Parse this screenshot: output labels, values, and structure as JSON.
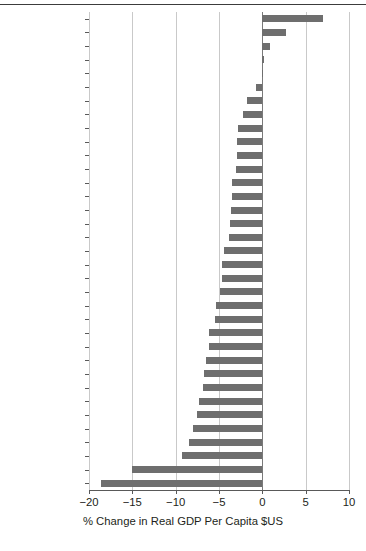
{
  "chart_data": {
    "type": "bar",
    "orientation": "horizontal",
    "title": "",
    "subtitle": "",
    "xlabel": "% Change in Real GDP Per Capita $US",
    "ylabel": "",
    "xlim": [
      -20,
      10
    ],
    "ylim": null,
    "xticks": [
      -20,
      -15,
      -10,
      -5,
      0,
      5,
      10
    ],
    "xticklabels": [
      "−20",
      "−15",
      "−10",
      "−5",
      "0",
      "5",
      "10"
    ],
    "grid": "vertical",
    "legend": "none",
    "bar_color": "#6e6e6e",
    "background_color": "#ffffff",
    "categories": [
      "Poland",
      "Korea",
      "Israel",
      "Chile",
      "Australia",
      "Slovakia",
      "New Zealand",
      "Switzerland",
      "Austria",
      "Netherlands",
      "Portugal",
      "Belgium",
      "Norway",
      "France",
      "Czech Republic",
      "Germany",
      "Canada",
      "United States",
      "Spain",
      "Greece",
      "Hungary",
      "Slovenia",
      "Mexico",
      "Japan",
      "United Kingdom",
      "Turkey",
      "Denmark",
      "Sweden",
      "Italy",
      "Iceland",
      "Finland",
      "Luxembourg",
      "Ireland",
      "Latvia",
      "Estonia"
    ],
    "values": [
      7.0,
      2.7,
      0.9,
      0.2,
      0.1,
      -0.7,
      -1.8,
      -2.2,
      -2.8,
      -2.9,
      -2.9,
      -3.0,
      -3.5,
      -3.5,
      -3.6,
      -3.7,
      -3.9,
      -4.4,
      -4.6,
      -4.7,
      -4.9,
      -5.4,
      -5.5,
      -6.2,
      -6.2,
      -6.5,
      -6.7,
      -6.9,
      -7.3,
      -7.5,
      -8.0,
      -8.5,
      -9.3,
      -15.0,
      -18.6
    ]
  }
}
